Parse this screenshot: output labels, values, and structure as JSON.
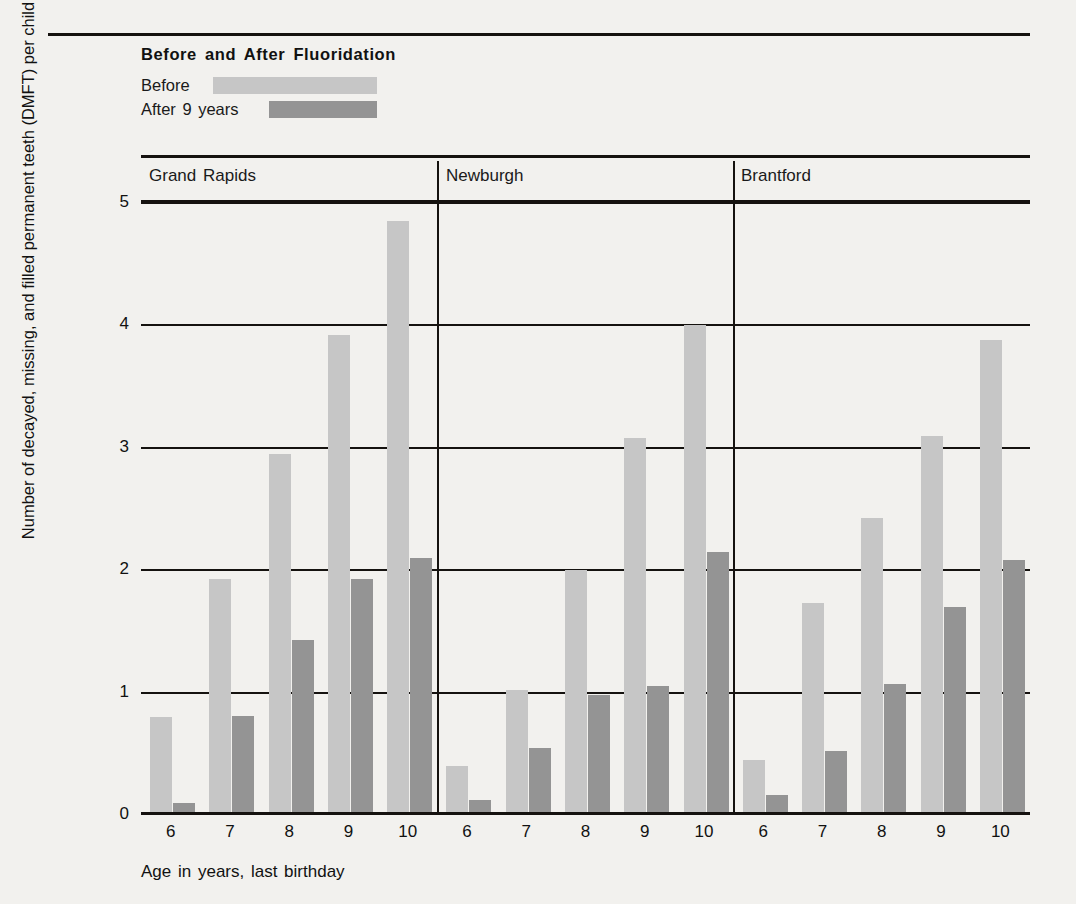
{
  "chart_data": {
    "type": "bar",
    "title": "Before and After Fluoridation",
    "xlabel": "Age in years, last birthday",
    "ylabel": "Number of decayed, missing, and filled permanent teeth (DMFT) per child",
    "ylim": [
      0,
      5
    ],
    "yticks": [
      "0",
      "1",
      "2",
      "3",
      "4",
      "5"
    ],
    "grid": true,
    "legend_position": "top-left",
    "colors": {
      "before": "#c6c6c6",
      "after": "#949494",
      "axis": "#15120f",
      "background": "#f2f1ee"
    },
    "series": [
      {
        "name": "Before",
        "key": "before"
      },
      {
        "name": "After 9 years",
        "key": "after"
      }
    ],
    "categories": [
      "6",
      "7",
      "8",
      "9",
      "10"
    ],
    "groups": [
      {
        "name": "Grand Rapids",
        "categories": [
          "6",
          "7",
          "8",
          "9",
          "10"
        ],
        "before": [
          0.8,
          1.93,
          2.95,
          3.92,
          4.85
        ],
        "after": [
          0.1,
          0.81,
          1.43,
          1.93,
          2.1
        ]
      },
      {
        "name": "Newburgh",
        "categories": [
          "6",
          "7",
          "8",
          "9",
          "10"
        ],
        "before": [
          0.4,
          1.02,
          2.0,
          3.08,
          4.0
        ],
        "after": [
          0.12,
          0.55,
          0.98,
          1.05,
          2.15
        ]
      },
      {
        "name": "Brantford",
        "categories": [
          "6",
          "7",
          "8",
          "9",
          "10"
        ],
        "before": [
          0.45,
          1.73,
          2.43,
          3.1,
          3.88
        ],
        "after": [
          0.16,
          0.52,
          1.07,
          1.7,
          2.08
        ]
      }
    ]
  },
  "legend": {
    "before_label": "Before",
    "after_label": "After 9 years"
  }
}
